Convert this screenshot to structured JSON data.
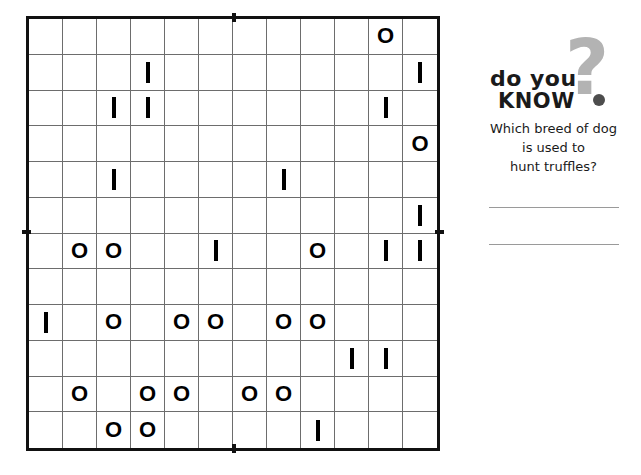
{
  "puzzle": {
    "name": "binary-logic-grid",
    "rows": 12,
    "cols": 12,
    "symbols": {
      "zero": "O",
      "one": "I",
      "empty": ""
    },
    "grid": [
      [
        "",
        "",
        "",
        "",
        "",
        "",
        "",
        "",
        "",
        "",
        "O",
        ""
      ],
      [
        "",
        "",
        "",
        "I",
        "",
        "",
        "",
        "",
        "",
        "",
        "",
        "I"
      ],
      [
        "",
        "",
        "I",
        "I",
        "",
        "",
        "",
        "",
        "",
        "",
        "I",
        ""
      ],
      [
        "",
        "",
        "",
        "",
        "",
        "",
        "",
        "",
        "",
        "",
        "",
        "O"
      ],
      [
        "",
        "",
        "I",
        "",
        "",
        "",
        "",
        "I",
        "",
        "",
        "",
        ""
      ],
      [
        "",
        "",
        "",
        "",
        "",
        "",
        "",
        "",
        "",
        "",
        "",
        "I"
      ],
      [
        "",
        "O",
        "O",
        "",
        "",
        "I",
        "",
        "",
        "O",
        "",
        "I",
        "I"
      ],
      [
        "",
        "",
        "",
        "",
        "",
        "",
        "",
        "",
        "",
        "",
        "",
        ""
      ],
      [
        "I",
        "",
        "O",
        "",
        "O",
        "O",
        "",
        "O",
        "O",
        "",
        "",
        ""
      ],
      [
        "",
        "",
        "",
        "",
        "",
        "",
        "",
        "",
        "",
        "I",
        "I",
        ""
      ],
      [
        "",
        "O",
        "",
        "O",
        "O",
        "",
        "O",
        "O",
        "",
        "",
        "",
        ""
      ],
      [
        "",
        "",
        "O",
        "O",
        "",
        "",
        "",
        "",
        "I",
        "",
        "",
        ""
      ]
    ]
  },
  "did_you_know": {
    "logo_line_1": "do you",
    "logo_line_2": "KNOW",
    "question_mark": "?",
    "question": "Which breed of dog is used to hunt truffles?",
    "question_line_1": "Which breed of dog",
    "question_line_2": "is used to",
    "question_line_3": "hunt truffles?",
    "answer_1": "",
    "answer_2": ""
  },
  "colors": {
    "grid_border": "#111111",
    "grid_line": "#6d6d6d",
    "symbol": "#000000",
    "logo_gray": "#b3b3b3",
    "logo_dark": "#1a1a1a",
    "answer_rule": "#9a9a9a"
  }
}
